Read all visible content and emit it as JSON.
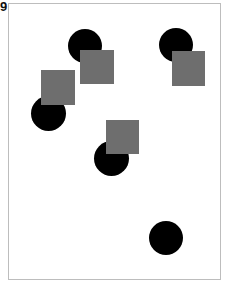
{
  "panel_label": "9",
  "colors": {
    "circle": "#000000",
    "square": "#6e6e6e",
    "frame_border": "#bdbdbd",
    "background": "#ffffff"
  },
  "shapes": [
    {
      "type": "circle",
      "cx": 85,
      "cy": 46,
      "d": 34
    },
    {
      "type": "circle",
      "cx": 176,
      "cy": 45,
      "d": 34
    },
    {
      "type": "circle",
      "cx": 48,
      "cy": 113,
      "d": 35
    },
    {
      "type": "circle",
      "cx": 111,
      "cy": 158,
      "d": 35
    },
    {
      "type": "circle",
      "cx": 166,
      "cy": 238,
      "d": 34
    },
    {
      "type": "square",
      "x": 80,
      "y": 50,
      "w": 34,
      "h": 34
    },
    {
      "type": "square",
      "x": 172,
      "y": 51,
      "w": 33,
      "h": 35
    },
    {
      "type": "square",
      "x": 41,
      "y": 70,
      "w": 34,
      "h": 35
    },
    {
      "type": "square",
      "x": 106,
      "y": 120,
      "w": 33,
      "h": 34
    }
  ]
}
